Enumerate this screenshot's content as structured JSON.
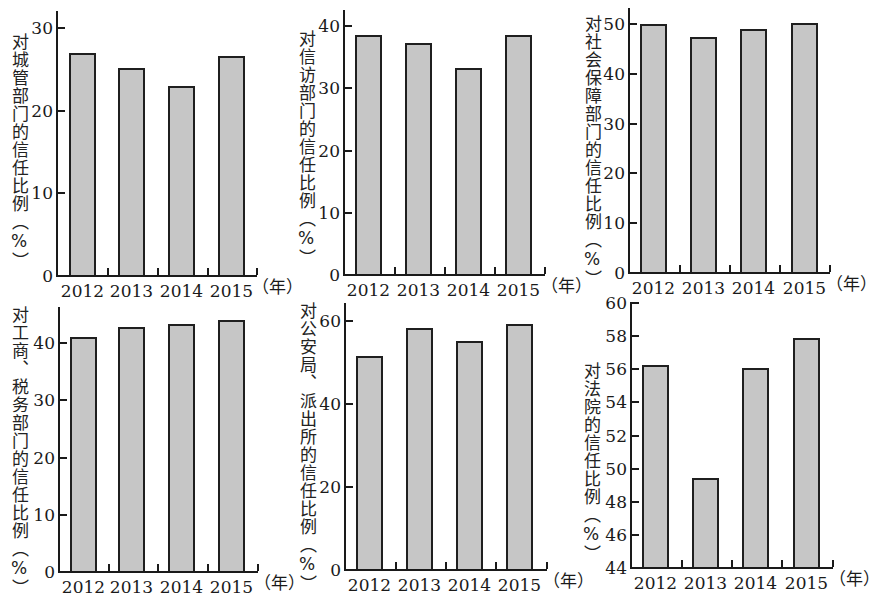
{
  "chart_data": [
    {
      "type": "bar",
      "ylabel": "对城管部门的信任比例（%）",
      "xlabel": "（年）",
      "categories": [
        "2012",
        "2013",
        "2014",
        "2015"
      ],
      "values": [
        26.9,
        25.0,
        22.9,
        26.5
      ],
      "yticks": [
        "0",
        "10",
        "20",
        "30"
      ],
      "ylim": [
        0,
        30
      ]
    },
    {
      "type": "bar",
      "ylabel": "对信访部门的信任比例（%）",
      "xlabel": "（年）",
      "categories": [
        "2012",
        "2013",
        "2014",
        "2015"
      ],
      "values": [
        38.4,
        37.1,
        33.1,
        38.4
      ],
      "yticks": [
        "0",
        "10",
        "20",
        "30",
        "40"
      ],
      "ylim": [
        0,
        40
      ]
    },
    {
      "type": "bar",
      "ylabel": "对社会保障部门的信任比例（%）",
      "xlabel": "（年）",
      "categories": [
        "2012",
        "2013",
        "2014",
        "2015"
      ],
      "values": [
        49.7,
        47.1,
        48.8,
        49.9
      ],
      "yticks": [
        "0",
        "10",
        "20",
        "30",
        "40",
        "50"
      ],
      "ylim": [
        0,
        50
      ]
    },
    {
      "type": "bar",
      "ylabel": "对工商、税务部门的信任比例（%）",
      "xlabel": "（年）",
      "categories": [
        "2012",
        "2013",
        "2014",
        "2015"
      ],
      "values": [
        40.9,
        42.7,
        43.1,
        43.8
      ],
      "yticks": [
        "0",
        "10",
        "20",
        "30",
        "40"
      ],
      "ylim": [
        0,
        40
      ]
    },
    {
      "type": "bar",
      "ylabel": "对公安局、派出所的信任比例（%）",
      "xlabel": "（年）",
      "categories": [
        "2012",
        "2013",
        "2014",
        "2015"
      ],
      "values": [
        51.4,
        58.0,
        55.0,
        59.1
      ],
      "yticks": [
        "0",
        "20",
        "40",
        "60"
      ],
      "ylim": [
        0,
        60
      ]
    },
    {
      "type": "bar",
      "ylabel": "对法院的信任比例（%）",
      "xlabel": "（年）",
      "categories": [
        "2012",
        "2013",
        "2014",
        "2015"
      ],
      "values": [
        56.2,
        49.4,
        56.0,
        57.8
      ],
      "yticks": [
        "44",
        "46",
        "48",
        "50",
        "52",
        "54",
        "56",
        "58",
        "60"
      ],
      "ylim": [
        44,
        60
      ]
    }
  ],
  "layout": [
    {
      "axisX": 56,
      "baseY": 275,
      "topY": 11,
      "endX": 257,
      "tickTopY": 27,
      "tickTopVal": 30,
      "min": 0,
      "labelX": 9,
      "labelY": 33,
      "barX": [
        69,
        118,
        168,
        218
      ],
      "unitX": 252,
      "unitY": 277
    },
    {
      "axisX": 343,
      "baseY": 274,
      "topY": 10,
      "endX": 545,
      "tickTopY": 25,
      "tickTopVal": 40,
      "min": 0,
      "labelX": 296,
      "labelY": 30,
      "barX": [
        355,
        405,
        455,
        505
      ],
      "unitX": 541,
      "unitY": 276
    },
    {
      "axisX": 628,
      "baseY": 272,
      "topY": 8,
      "endX": 830,
      "tickTopY": 23,
      "tickTopVal": 50,
      "min": 0,
      "labelX": 582,
      "labelY": 15,
      "barX": [
        640,
        690,
        740,
        791
      ],
      "unitX": 826,
      "unitY": 274
    },
    {
      "axisX": 58,
      "baseY": 571,
      "topY": 307,
      "endX": 258,
      "tickTopY": 342,
      "tickTopVal": 40,
      "min": 0,
      "labelX": 9,
      "labelY": 306,
      "barX": [
        70,
        118,
        168,
        218
      ],
      "unitX": 254,
      "unitY": 573
    },
    {
      "axisX": 344,
      "baseY": 569,
      "topY": 303,
      "endX": 547,
      "tickTopY": 320,
      "tickTopVal": 60,
      "min": 0,
      "labelX": 297,
      "labelY": 302,
      "barX": [
        356,
        406,
        456,
        506
      ],
      "unitX": 543,
      "unitY": 571
    },
    {
      "axisX": 630,
      "baseY": 567,
      "topY": 302,
      "endX": 833,
      "tickTopY": 302,
      "tickTopVal": 60,
      "min": 44,
      "labelX": 581,
      "labelY": 362,
      "barX": [
        642,
        692,
        742,
        793
      ],
      "unitX": 829,
      "unitY": 569
    }
  ],
  "colors": {
    "bar_fill": "#c6c6c6",
    "bar_border": "#1f1f1f",
    "axis": "#1a1a1a"
  }
}
